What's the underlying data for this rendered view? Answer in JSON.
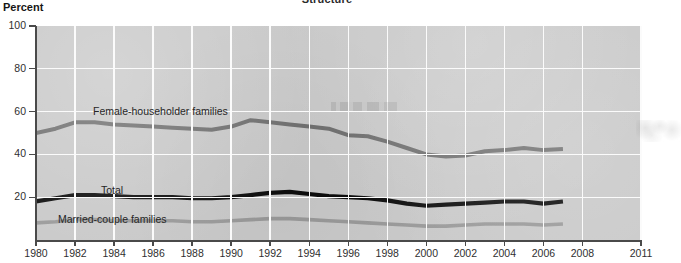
{
  "chart_title": "Structure",
  "unit_label": "Percent",
  "axes": {
    "y_ticks": [
      "100",
      "80",
      "60",
      "40",
      "20"
    ],
    "y_values": [
      100,
      80,
      60,
      40,
      20
    ],
    "x_ticks": [
      "1980",
      "1982",
      "1984",
      "1986",
      "1988",
      "1990",
      "1992",
      "1994",
      "1996",
      "1998",
      "2000",
      "2002",
      "2004",
      "2006",
      "2008",
      "2011"
    ],
    "x_values": [
      1980,
      1982,
      1984,
      1986,
      1988,
      1990,
      1992,
      1994,
      1996,
      1998,
      2000,
      2002,
      2004,
      2006,
      2008,
      2011
    ]
  },
  "series_labels": {
    "female": "Female-householder families",
    "total": "Total",
    "married": "Married-couple families"
  },
  "colors": {
    "plot_background": "#c9c9c9",
    "gridline": "#fbfbfb",
    "axis": "#4a4a4a",
    "total_line": "#0d0d0d",
    "female_line": "#6f6f6f",
    "married_line": "#9a9a9a",
    "text": "#2f2f2f"
  },
  "chart_data": {
    "type": "line",
    "title": "Structure",
    "xlabel": "",
    "ylabel": "Percent",
    "xlim": [
      1980,
      2011
    ],
    "ylim": [
      0,
      100
    ],
    "grid": true,
    "legend": "inline-labels",
    "x": [
      1980,
      1981,
      1982,
      1983,
      1984,
      1985,
      1986,
      1987,
      1988,
      1989,
      1990,
      1991,
      1992,
      1993,
      1994,
      1995,
      1996,
      1997,
      1998,
      1999,
      2000,
      2001,
      2002,
      2003,
      2004,
      2005,
      2006,
      2007
    ],
    "series": [
      {
        "name": "Female-householder families",
        "color": "#6f6f6f",
        "values": [
          50.0,
          52.0,
          55.0,
          55.0,
          54.0,
          53.5,
          53.0,
          52.5,
          52.0,
          51.5,
          53.0,
          56.0,
          55.0,
          54.0,
          53.0,
          52.0,
          49.0,
          48.5,
          46.0,
          43.0,
          40.0,
          39.0,
          39.5,
          41.5,
          42.0,
          43.0,
          42.0,
          42.5
        ]
      },
      {
        "name": "Total",
        "color": "#0d0d0d",
        "values": [
          18.0,
          19.5,
          21.0,
          21.0,
          20.5,
          20.0,
          20.0,
          20.0,
          19.5,
          19.5,
          20.0,
          21.0,
          22.0,
          22.5,
          21.5,
          20.5,
          20.0,
          19.5,
          18.5,
          17.0,
          16.0,
          16.5,
          17.0,
          17.5,
          18.0,
          18.0,
          17.0,
          18.0
        ]
      },
      {
        "name": "Married-couple families",
        "color": "#9a9a9a",
        "values": [
          8.0,
          8.5,
          9.5,
          9.5,
          9.0,
          9.0,
          9.0,
          9.0,
          8.5,
          8.5,
          9.0,
          9.5,
          10.0,
          10.0,
          9.5,
          9.0,
          8.5,
          8.0,
          7.5,
          7.0,
          6.5,
          6.5,
          7.0,
          7.5,
          7.5,
          7.5,
          7.0,
          7.5
        ]
      }
    ]
  }
}
